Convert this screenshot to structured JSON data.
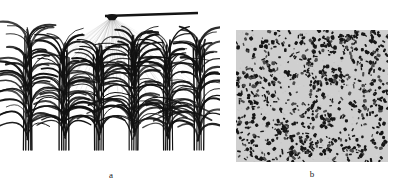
{
  "figure": {
    "kind": "two-panel scientific figure",
    "background_color": "#ffffff",
    "top_text_remnant": "                                                                                                       ",
    "panels": [
      {
        "id": "a",
        "label": "a",
        "caption_label": "a",
        "title": "",
        "description": "3D maize canopy row model illuminated by a linear light source emitting a fan of light rays",
        "ink_color": "#111111",
        "ray_color": "#9a9a9a",
        "light_source": {
          "name": "linear-light-bar",
          "origin_x": 112,
          "origin_y": 13,
          "bar_x1": 105,
          "bar_y1": 12,
          "bar_x2": 198,
          "bar_y2": 9,
          "bar_thickness": 2.4,
          "bar_color": "#151515"
        },
        "rays": {
          "count": 46,
          "spread_left_x": 6,
          "spread_right_x": 216,
          "end_y": 74,
          "opacity": 0.42,
          "width": 0.45
        },
        "canopy": {
          "plant_count": 6,
          "plant_centers": [
            28,
            64,
            99,
            134,
            168,
            199
          ],
          "base_y": 146,
          "top_y": 36,
          "leaves_per_plant": 22,
          "stem_count_per_plant": 5,
          "stem_color": "#101010"
        }
      },
      {
        "id": "b",
        "label": "b",
        "caption_label": "b",
        "title": "",
        "description": "Simulated sunfleck / light-spot distribution pattern on the ground beneath the canopy",
        "frame": {
          "x": 236,
          "y": 30,
          "width": 152,
          "height": 132
        },
        "background_color": "#cfcfcf",
        "speck_color": "#161616",
        "speck_count": 900,
        "speck_min_size": 1.1,
        "speck_max_size": 4.6,
        "coverage_fraction": 0.27
      }
    ]
  },
  "chart_data": {
    "type": "scatter",
    "title": "",
    "xlabel": "",
    "ylabel": "",
    "legend": [],
    "panels": [
      {
        "name": "a",
        "label": "a",
        "type": "diagram"
      },
      {
        "name": "b",
        "label": "b",
        "type": "scatter"
      }
    ]
  }
}
